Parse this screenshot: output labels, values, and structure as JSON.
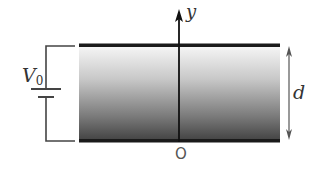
{
  "diagram": {
    "type": "parallel-plate-capacitor",
    "labels": {
      "voltage_symbol": "V",
      "voltage_subscript": "0",
      "axis": "y",
      "separation": "d",
      "origin": "O"
    },
    "colors": {
      "plate": "#1a1a1a",
      "wire": "#444444",
      "gradient_top": "#f4f4f4",
      "gradient_bottom": "#4a4a4a"
    }
  }
}
